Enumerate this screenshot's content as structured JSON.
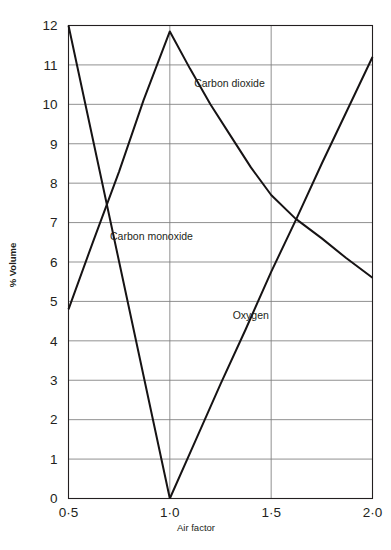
{
  "chart_data": {
    "type": "line",
    "title": "",
    "xlabel": "Air factor",
    "ylabel": "% Volume",
    "xlim": [
      0.5,
      2.0
    ],
    "ylim": [
      0,
      12
    ],
    "grid": true,
    "legend": "inline-annotations",
    "x_tick_labels": [
      "0·5",
      "1·0",
      "1·5",
      "2·0"
    ],
    "x_tick_values": [
      0.5,
      1.0,
      1.5,
      2.0
    ],
    "y_tick_labels": [
      "0",
      "1",
      "2",
      "3",
      "4",
      "5",
      "6",
      "7",
      "8",
      "9",
      "10",
      "11",
      "12"
    ],
    "y_tick_values": [
      0,
      1,
      2,
      3,
      4,
      5,
      6,
      7,
      8,
      9,
      10,
      11,
      12
    ],
    "series": [
      {
        "name": "Carbon dioxide",
        "label": "Carbon dioxide",
        "label_x": 1.12,
        "label_y": 10.45,
        "x": [
          0.5,
          0.62,
          0.75,
          0.87,
          1.0,
          1.1,
          1.2,
          1.3,
          1.4,
          1.5,
          1.62,
          1.75,
          1.87,
          2.0
        ],
        "y": [
          4.8,
          6.5,
          8.3,
          10.1,
          11.85,
          10.9,
          10.0,
          9.2,
          8.4,
          7.7,
          7.1,
          6.6,
          6.1,
          5.6
        ]
      },
      {
        "name": "Carbon monoxide",
        "label": "Carbon monoxide",
        "label_x": 0.705,
        "label_y": 6.55,
        "x": [
          0.5,
          0.625,
          0.75,
          0.875,
          1.0
        ],
        "y": [
          12.0,
          9.0,
          6.0,
          3.0,
          0.0
        ]
      },
      {
        "name": "Oxygen",
        "label": "Oxygen",
        "label_x": 1.31,
        "label_y": 4.55,
        "x": [
          1.0,
          1.125,
          1.25,
          1.375,
          1.5,
          1.625,
          1.75,
          1.875,
          2.0
        ],
        "y": [
          0.0,
          1.45,
          2.9,
          4.3,
          5.75,
          7.1,
          8.5,
          9.85,
          11.2
        ]
      }
    ]
  },
  "colors": {
    "axis": "#231f20",
    "grid": "#7d7d7d",
    "series": "#161314",
    "background": "#ffffff"
  }
}
